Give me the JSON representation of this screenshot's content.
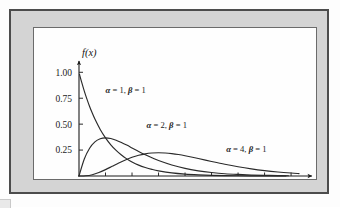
{
  "figure": {
    "kind": "gamma-density-plot",
    "panel_background": "#fefefe",
    "mat_color": "#d4d4d4",
    "frame_color": "#4c4c4c",
    "curve_color": "#2a2a2a"
  },
  "chart_data": {
    "type": "line",
    "title": "",
    "subtitle": "",
    "xlabel": "x",
    "ylabel": "f(x)",
    "xlim": [
      0,
      8.6
    ],
    "ylim": [
      0,
      1.08
    ],
    "xticks": [
      0,
      1,
      2,
      3,
      4,
      5,
      6,
      7,
      8
    ],
    "xtick_labels": [
      "0",
      "1",
      "2",
      "3",
      "4",
      "5",
      "6",
      "7",
      "8"
    ],
    "yticks": [
      0.25,
      0.5,
      0.75,
      1.0
    ],
    "ytick_labels": [
      "0.25",
      "0.50",
      "0.75",
      "1.00"
    ],
    "grid": false,
    "legend_position": "inline-annotations",
    "x_axis_arrow": true,
    "y_axis_arrow": true,
    "series": [
      {
        "name": "alpha = 1, beta = 1",
        "alpha": 1,
        "beta": 1,
        "label": "α = 1, β = 1",
        "label_x": 1.0,
        "label_y": 0.8,
        "x": [
          0.02,
          0.1,
          0.2,
          0.3,
          0.4,
          0.5,
          0.6,
          0.8,
          1.0,
          1.2,
          1.4,
          1.6,
          1.8,
          2.0,
          2.25,
          2.5,
          2.75,
          3.0,
          3.5,
          4.0,
          4.5,
          5.0,
          5.5,
          6.0,
          6.5,
          7.0,
          7.5,
          7.8
        ],
        "y": [
          0.98,
          0.905,
          0.819,
          0.741,
          0.67,
          0.607,
          0.549,
          0.449,
          0.368,
          0.301,
          0.247,
          0.202,
          0.165,
          0.135,
          0.105,
          0.082,
          0.064,
          0.05,
          0.03,
          0.018,
          0.011,
          0.0067,
          0.0041,
          0.0025,
          0.0015,
          0.0009,
          0.0006,
          0.0004
        ]
      },
      {
        "name": "alpha = 2, beta = 1",
        "alpha": 2,
        "beta": 1,
        "label": "α = 2, β = 1",
        "label_x": 2.55,
        "label_y": 0.465,
        "x": [
          0.0,
          0.2,
          0.4,
          0.6,
          0.8,
          1.0,
          1.2,
          1.4,
          1.6,
          1.8,
          2.0,
          2.25,
          2.5,
          2.75,
          3.0,
          3.5,
          4.0,
          4.5,
          5.0,
          5.5,
          6.0,
          6.5,
          7.0,
          7.5,
          7.9
        ],
        "y": [
          0.0,
          0.164,
          0.268,
          0.329,
          0.359,
          0.368,
          0.361,
          0.345,
          0.323,
          0.298,
          0.271,
          0.237,
          0.205,
          0.176,
          0.149,
          0.106,
          0.073,
          0.05,
          0.034,
          0.022,
          0.015,
          0.01,
          0.0064,
          0.0041,
          0.0029
        ]
      },
      {
        "name": "alpha = 4, beta = 1",
        "alpha": 4,
        "beta": 1,
        "label": "α = 4, β = 1",
        "label_x": 5.55,
        "label_y": 0.235,
        "x": [
          0.0,
          0.25,
          0.5,
          0.75,
          1.0,
          1.25,
          1.5,
          1.75,
          2.0,
          2.25,
          2.5,
          2.75,
          3.0,
          3.25,
          3.5,
          3.75,
          4.0,
          4.5,
          5.0,
          5.5,
          6.0,
          6.5,
          7.0,
          7.5,
          8.0,
          8.3
        ],
        "y": [
          0.0,
          0.0021,
          0.0126,
          0.0332,
          0.0613,
          0.0933,
          0.1255,
          0.1552,
          0.1804,
          0.2002,
          0.2138,
          0.2215,
          0.224,
          0.2218,
          0.2158,
          0.2069,
          0.1954,
          0.1687,
          0.1404,
          0.1133,
          0.0892,
          0.0688,
          0.0521,
          0.0389,
          0.0286,
          0.0235
        ]
      }
    ]
  }
}
